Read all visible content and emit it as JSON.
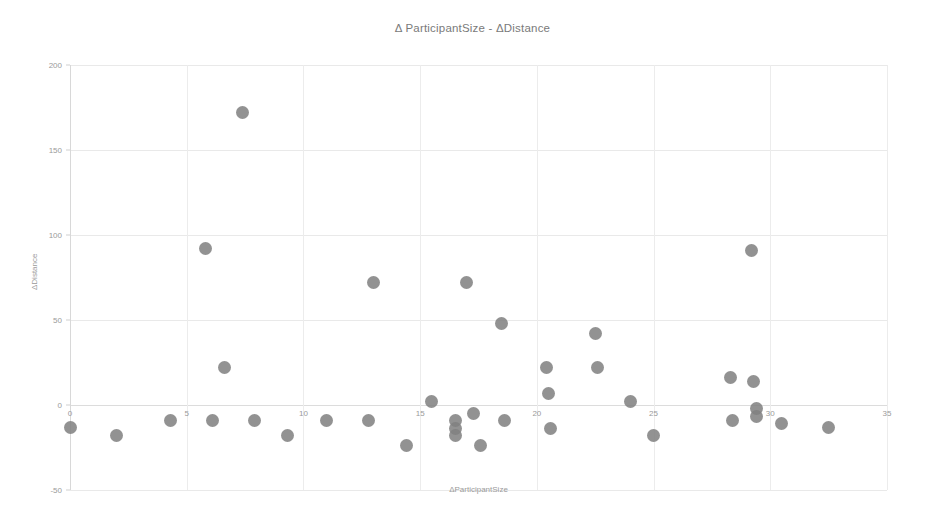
{
  "chart_data": {
    "type": "scatter",
    "title": "Δ ParticipantSize - ΔDistance",
    "xlabel": "ΔParticipantSize",
    "ylabel": "ΔDistance",
    "xlim": [
      0,
      35
    ],
    "ylim": [
      -50,
      200
    ],
    "xticks": [
      0,
      5,
      10,
      15,
      20,
      25,
      30,
      35
    ],
    "xtick_labels": [
      "0",
      "5",
      "10",
      "15",
      "20",
      "25",
      "30",
      "35"
    ],
    "yticks": [
      -50,
      0,
      50,
      100,
      150,
      200
    ],
    "ytick_labels": [
      "-50",
      "0",
      "50",
      "100",
      "150",
      "200"
    ],
    "grid": true,
    "legend": "none",
    "marker_color": "#808080",
    "series": [
      {
        "name": "observations",
        "points": [
          [
            0.0,
            -13
          ],
          [
            2.0,
            -18
          ],
          [
            4.3,
            -9
          ],
          [
            5.8,
            92
          ],
          [
            6.1,
            -9
          ],
          [
            6.6,
            22
          ],
          [
            7.4,
            172
          ],
          [
            7.9,
            -9
          ],
          [
            9.3,
            -18
          ],
          [
            11.0,
            -9
          ],
          [
            12.8,
            -9
          ],
          [
            13.0,
            72
          ],
          [
            14.4,
            -24
          ],
          [
            15.5,
            2
          ],
          [
            16.5,
            -9
          ],
          [
            16.5,
            -14
          ],
          [
            16.5,
            -18
          ],
          [
            17.0,
            72
          ],
          [
            17.3,
            -5
          ],
          [
            17.6,
            -24
          ],
          [
            18.5,
            48
          ],
          [
            18.6,
            -9
          ],
          [
            20.4,
            22
          ],
          [
            20.5,
            7
          ],
          [
            20.6,
            -14
          ],
          [
            22.5,
            42
          ],
          [
            22.6,
            22
          ],
          [
            24.0,
            2
          ],
          [
            25.0,
            -18
          ],
          [
            28.3,
            16
          ],
          [
            28.4,
            -9
          ],
          [
            29.2,
            91
          ],
          [
            29.3,
            14
          ],
          [
            29.4,
            -2
          ],
          [
            29.4,
            -7
          ],
          [
            30.5,
            -11
          ],
          [
            32.5,
            -13
          ]
        ]
      }
    ]
  },
  "axes": {
    "title": "Δ ParticipantSize - ΔDistance",
    "x_title": "ΔParticipantSize",
    "y_title": "ΔDistance"
  }
}
